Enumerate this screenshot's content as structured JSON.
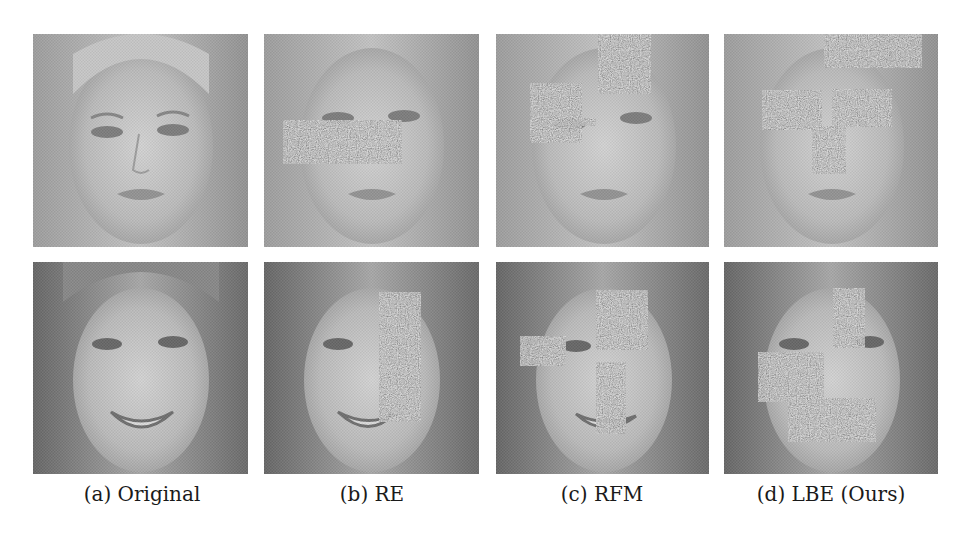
{
  "figure": {
    "columns": [
      {
        "label": "(a) Original",
        "method": "Original",
        "center_x": 142
      },
      {
        "label": "(b) RE",
        "method": "RE",
        "center_x": 372
      },
      {
        "label": "(c) RFM",
        "method": "RFM",
        "center_x": 602
      },
      {
        "label": "(d) LBE (Ours)",
        "method": "LBE (Ours)",
        "center_x": 831
      }
    ],
    "rows": [
      {
        "subject": "face-1-blonde-straight-hair"
      },
      {
        "subject": "face-2-wavy-hair-smiling"
      }
    ],
    "panel_positions": {
      "col_x": [
        33,
        264,
        496,
        724
      ],
      "col_w": [
        215,
        215,
        213,
        214
      ],
      "row_y": [
        34,
        262
      ],
      "row_h": [
        213,
        212
      ]
    },
    "occlusions": {
      "row0": {
        "original": [],
        "re": [
          {
            "shape": "rect",
            "x": 19,
            "y": 86,
            "w": 119,
            "h": 44
          }
        ],
        "rfm": [
          {
            "shape": "rect",
            "x": 102,
            "y": 0,
            "w": 53,
            "h": 60
          },
          {
            "shape": "rect",
            "x": 34,
            "y": 49,
            "w": 52,
            "h": 60
          },
          {
            "shape": "rect",
            "x": 86,
            "y": 84,
            "w": 14,
            "h": 8
          }
        ],
        "lbe": [
          {
            "shape": "rect",
            "x": 100,
            "y": 0,
            "w": 98,
            "h": 34
          },
          {
            "shape": "ellipse",
            "cx": 68,
            "cy": 76,
            "rx": 30,
            "ry": 20
          },
          {
            "shape": "ellipse",
            "cx": 138,
            "cy": 74,
            "rx": 30,
            "ry": 19
          },
          {
            "shape": "triangle",
            "points": "104,92 88,140 122,138"
          }
        ]
      },
      "row1": {
        "original": [],
        "re": [
          {
            "shape": "rect",
            "x": 115,
            "y": 30,
            "w": 42,
            "h": 130
          }
        ],
        "rfm": [
          {
            "shape": "rect",
            "x": 100,
            "y": 28,
            "w": 52,
            "h": 60
          },
          {
            "shape": "rect",
            "x": 24,
            "y": 74,
            "w": 46,
            "h": 30
          },
          {
            "shape": "rect",
            "x": 100,
            "y": 100,
            "w": 30,
            "h": 72
          }
        ],
        "lbe": [
          {
            "shape": "ellipse",
            "cx": 125,
            "cy": 56,
            "rx": 16,
            "ry": 30
          },
          {
            "shape": "polygon",
            "points": "34,98 100,90 76,136 38,140"
          },
          {
            "shape": "ellipse",
            "cx": 108,
            "cy": 158,
            "rx": 44,
            "ry": 22
          }
        ]
      }
    },
    "colors": {
      "background": "#ffffff",
      "caption_text": "#1a1a1a",
      "noise_base": "#7e7e7e"
    }
  }
}
